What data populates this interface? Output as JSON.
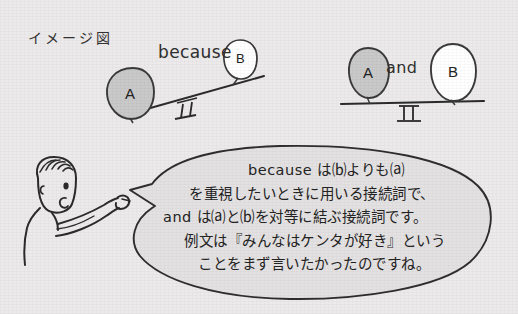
{
  "page": {
    "title": "イメージ図",
    "background_color": "#eceaea",
    "ink_color": "#2b2b2b"
  },
  "diagram_left": {
    "name": "because-seesaw",
    "connector_label": "because",
    "balance": "tilted-left",
    "balloons": [
      {
        "letter": "A",
        "fill": "#c9c9c9",
        "side": "left",
        "position": "low"
      },
      {
        "letter": "B",
        "fill": "#ffffff",
        "side": "right",
        "position": "high"
      }
    ]
  },
  "diagram_right": {
    "name": "and-seesaw",
    "connector_label": "and",
    "balance": "level",
    "balloons": [
      {
        "letter": "A",
        "fill": "#c9c9c9",
        "side": "left",
        "position": "level"
      },
      {
        "letter": "B",
        "fill": "#ffffff",
        "side": "right",
        "position": "level"
      }
    ]
  },
  "speaker": {
    "name": "boy-pointing",
    "pose": "pointing-right"
  },
  "speech_bubble": {
    "fill": "#e3e1e1",
    "lines": [
      "because は⒝よりも⒜",
      "を重視したいときに用いる接続詞で、",
      "and は⒜と⒝を対等に結ぶ接続詞です。",
      "例文は『みんなはケンタが好き』という",
      "ことをまず言いたかったのですね。"
    ]
  }
}
